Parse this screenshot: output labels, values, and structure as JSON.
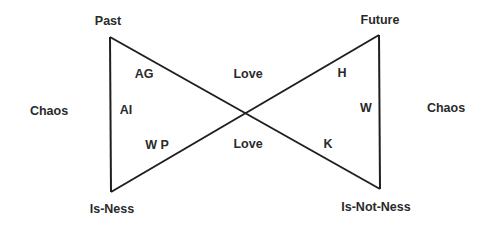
{
  "diagram": {
    "type": "bowtie",
    "line_color": "#1f1f1f",
    "text_color": "#2a2a2a",
    "vertices": {
      "past": "Past",
      "future": "Future",
      "is_ness": "Is-Ness",
      "is_not_ness": "Is-Not-Ness"
    },
    "sides": {
      "left": "Chaos",
      "right": "Chaos"
    },
    "center": {
      "top": "Love",
      "bottom": "Love"
    },
    "left_triangle": {
      "top_inner": "AG",
      "middle_inner": "AI",
      "bottom_inner": "W P"
    },
    "right_triangle": {
      "top_inner": "H",
      "middle_inner": "W",
      "bottom_inner": "K"
    }
  }
}
